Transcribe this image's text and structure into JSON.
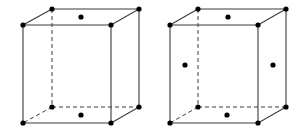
{
  "diagram": {
    "type": "crystal-unit-cells",
    "colors": {
      "edge": "#3a3a3a",
      "atom": "#000000",
      "background": "#ffffff"
    },
    "cells": [
      {
        "id": "base-centered",
        "corners": {
          "front_top_left": [
            23,
            25
          ],
          "front_top_right": [
            111,
            25
          ],
          "back_top_left": [
            52,
            9
          ],
          "back_top_right": [
            139,
            9
          ],
          "front_bottom_left": [
            23,
            123
          ],
          "front_bottom_right": [
            111,
            123
          ],
          "back_bottom_left": [
            52,
            107
          ],
          "back_bottom_right": [
            139,
            107
          ]
        },
        "extra_atoms": [
          {
            "position": "top-face-center",
            "xy": [
              81,
              17
            ]
          },
          {
            "position": "bottom-face-center",
            "xy": [
              81,
              115
            ]
          }
        ]
      },
      {
        "id": "face-centered",
        "corners": {
          "front_top_left": [
            170,
            25
          ],
          "front_top_right": [
            258,
            25
          ],
          "back_top_left": [
            198,
            9
          ],
          "back_top_right": [
            286,
            9
          ],
          "front_bottom_left": [
            170,
            123
          ],
          "front_bottom_right": [
            258,
            123
          ],
          "back_bottom_left": [
            198,
            107
          ],
          "back_bottom_right": [
            286,
            107
          ]
        },
        "extra_atoms": [
          {
            "position": "top-face-center",
            "xy": [
              228,
              17
            ]
          },
          {
            "position": "bottom-face-center",
            "xy": [
              227,
              115
            ]
          },
          {
            "position": "left-face-center",
            "xy": [
              185,
              65
            ]
          },
          {
            "position": "right-face-center",
            "xy": [
              273,
              65
            ]
          }
        ]
      }
    ]
  }
}
